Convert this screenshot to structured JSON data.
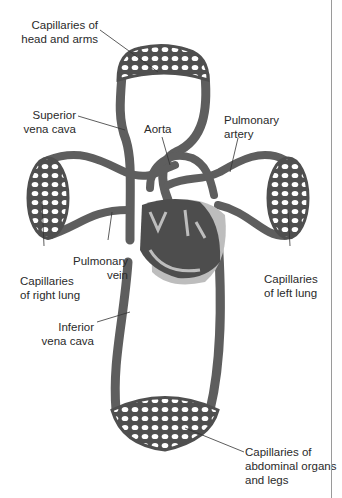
{
  "diagram": {
    "labels": {
      "head_arms": "Capillaries of\nhead and arms",
      "superior_vena_cava": "Superior\nvena cava",
      "aorta": "Aorta",
      "pulmonary_artery": "Pulmonary\nartery",
      "pulmonary_vein": "Pulmonary\nvein",
      "right_lung": "Capillaries\nof right lung",
      "left_lung": "Capillaries\nof left lung",
      "inferior_vena_cava": "Inferior\nvena cava",
      "abdominal_legs": "Capillaries of\nabdominal organs\nand legs"
    },
    "colors": {
      "vessel": "#5e5e5e",
      "vessel_dark": "#4a4a4a",
      "heart": "#4d4d4d",
      "pericardium": "#bdbdbd",
      "leader": "#333333",
      "edge": "#9a9a9a"
    }
  }
}
